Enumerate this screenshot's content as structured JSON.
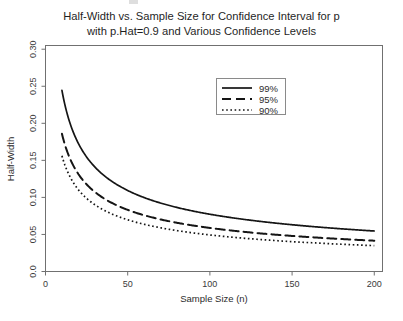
{
  "chart": {
    "title": "Half-Width vs. Sample Size for Confidence Interval for p\nwith p.Hat=0.9 and Various Confidence Levels",
    "xlabel": "Sample Size (n)",
    "ylabel": "Half-Width"
  },
  "chart_data": {
    "type": "line",
    "title": "Half-Width vs. Sample Size for Confidence Interval for p with p.Hat=0.9 and Various Confidence Levels",
    "xlabel": "Sample Size (n)",
    "ylabel": "Half-Width",
    "xlim": [
      0,
      205
    ],
    "ylim": [
      0.0,
      0.305
    ],
    "xticks": [
      0,
      50,
      100,
      150,
      200
    ],
    "xtick_labels": [
      "0",
      "50",
      "100",
      "150",
      "200"
    ],
    "yticks": [
      0.0,
      0.05,
      0.1,
      0.15,
      0.2,
      0.25,
      0.3
    ],
    "ytick_labels": [
      "0.0",
      "0.05",
      "0.10",
      "0.15",
      "0.20",
      "0.25",
      "0.30"
    ],
    "grid": false,
    "legend_position": "top-right-inside",
    "p_hat": 0.9,
    "x": [
      10,
      12,
      14,
      16,
      18,
      20,
      25,
      30,
      35,
      40,
      45,
      50,
      60,
      70,
      80,
      90,
      100,
      110,
      120,
      130,
      140,
      150,
      160,
      170,
      180,
      190,
      200
    ],
    "series": [
      {
        "name": "99%",
        "label": "99%",
        "linestyle": "solid",
        "z": 2.576,
        "color": "#151515",
        "values": [
          0.2444,
          0.2231,
          0.2066,
          0.1933,
          0.1822,
          0.1728,
          0.1546,
          0.1411,
          0.1306,
          0.1222,
          0.1152,
          0.1093,
          0.0998,
          0.0924,
          0.0864,
          0.0815,
          0.0773,
          0.0737,
          0.0706,
          0.0678,
          0.0653,
          0.0631,
          0.0611,
          0.0593,
          0.0576,
          0.0561,
          0.0547
        ]
      },
      {
        "name": "95%",
        "label": "95%",
        "linestyle": "dashed",
        "z": 1.96,
        "color": "#151515",
        "values": [
          0.1859,
          0.1697,
          0.1571,
          0.147,
          0.1386,
          0.1315,
          0.1176,
          0.1073,
          0.0994,
          0.093,
          0.0877,
          0.0831,
          0.0759,
          0.0703,
          0.0657,
          0.062,
          0.0588,
          0.0561,
          0.0537,
          0.0516,
          0.0497,
          0.048,
          0.0465,
          0.0451,
          0.0438,
          0.0427,
          0.0416
        ]
      },
      {
        "name": "90%",
        "label": "90%",
        "linestyle": "dotted",
        "z": 1.645,
        "color": "#151515",
        "values": [
          0.1561,
          0.1425,
          0.1319,
          0.1234,
          0.1163,
          0.1103,
          0.0987,
          0.0901,
          0.0834,
          0.078,
          0.0736,
          0.0698,
          0.0637,
          0.059,
          0.0552,
          0.052,
          0.0494,
          0.0471,
          0.0451,
          0.0433,
          0.0417,
          0.0403,
          0.039,
          0.0379,
          0.0368,
          0.0358,
          0.0349
        ]
      }
    ]
  }
}
